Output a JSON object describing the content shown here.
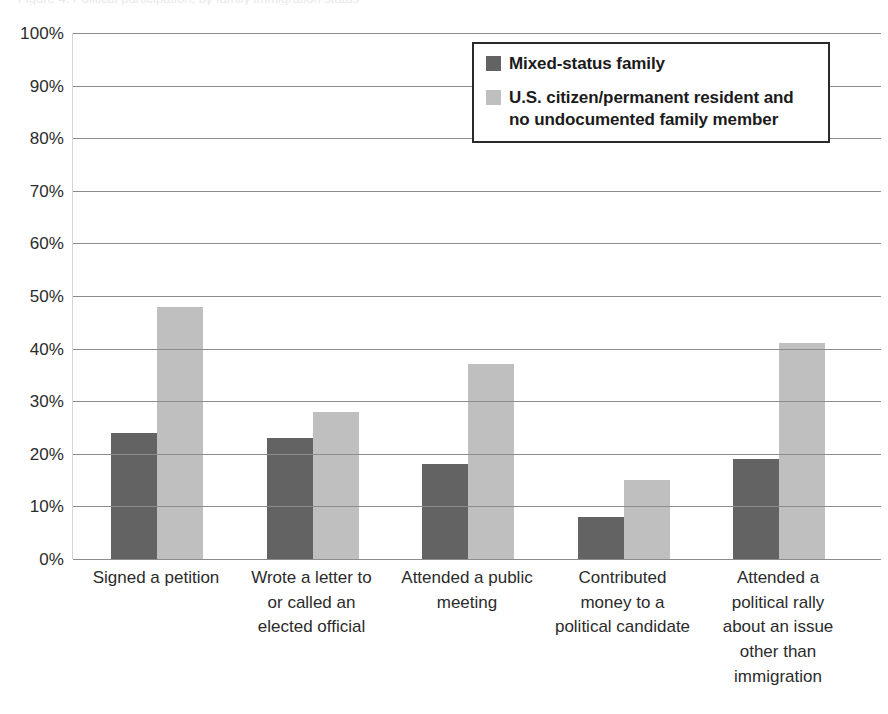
{
  "clipped_title": "Figure 4. Political participation, by family immigration status",
  "legend": {
    "entries": [
      {
        "label": "Mixed-status family",
        "color": "#636363",
        "swatch_name": "legend-swatch-dark"
      },
      {
        "label": "U.S. citizen/permanent resident and no undocumented family member",
        "color": "#bfbfbf",
        "swatch_name": "legend-swatch-light"
      }
    ]
  },
  "chart_data": {
    "type": "bar",
    "title": "",
    "xlabel": "",
    "ylabel": "",
    "ylim": [
      0,
      100
    ],
    "yticks": [
      "0%",
      "10%",
      "20%",
      "30%",
      "40%",
      "50%",
      "60%",
      "70%",
      "80%",
      "90%",
      "100%"
    ],
    "ytick_values": [
      0,
      10,
      20,
      30,
      40,
      50,
      60,
      70,
      80,
      90,
      100
    ],
    "grid": true,
    "legend_position": "top-right-inside",
    "categories": [
      "Signed a petition",
      "Wrote a letter to or called an elected official",
      "Attended a public meeting",
      "Contributed money to a political candidate",
      "Attended a political rally about an issue other than immigration"
    ],
    "category_lines": [
      [
        "Signed a petition"
      ],
      [
        "Wrote a letter to",
        "or called an",
        "elected official"
      ],
      [
        "Attended a public",
        "meeting"
      ],
      [
        "Contributed",
        "money to a",
        "political candidate"
      ],
      [
        "Attended a",
        "political rally",
        "about an issue",
        "other than",
        "immigration"
      ]
    ],
    "series": [
      {
        "name": "Mixed-status family",
        "color": "#636363",
        "values": [
          24,
          23,
          18,
          8,
          19
        ]
      },
      {
        "name": "U.S. citizen/permanent resident and no undocumented family member",
        "color": "#bfbfbf",
        "values": [
          48,
          28,
          37,
          15,
          41
        ]
      }
    ]
  }
}
